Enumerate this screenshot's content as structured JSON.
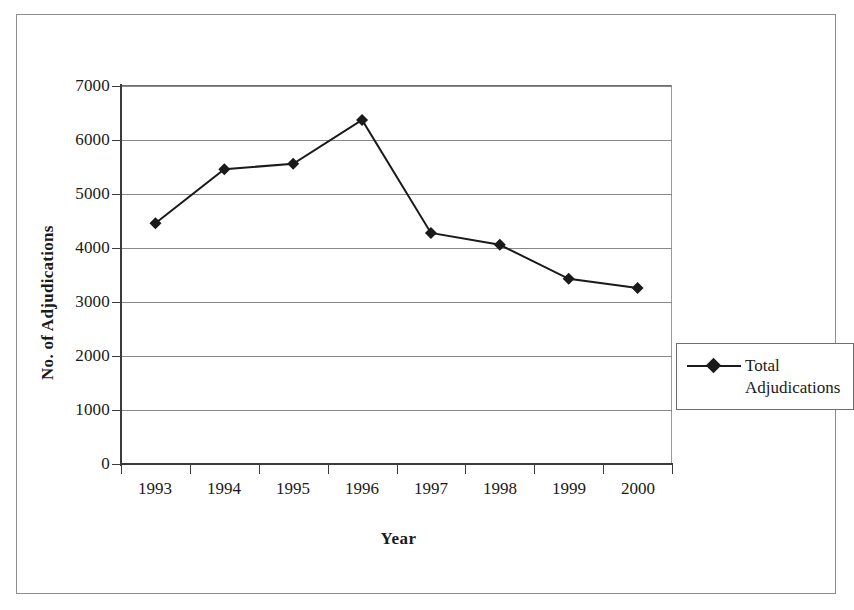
{
  "chart_data": {
    "type": "line",
    "title": "",
    "xlabel": "Year",
    "ylabel": "No. of Adjudications",
    "categories": [
      "1993",
      "1994",
      "1995",
      "1996",
      "1997",
      "1998",
      "1999",
      "2000"
    ],
    "series": [
      {
        "name": "Total Adjudications",
        "marker": "diamond",
        "color": "#1a1a1a",
        "values": [
          4460,
          5460,
          5560,
          6370,
          4280,
          4060,
          3430,
          3260
        ]
      }
    ],
    "ylim": [
      0,
      7000
    ],
    "ytick_values": [
      0,
      1000,
      2000,
      3000,
      4000,
      5000,
      6000,
      7000
    ],
    "ytick_labels": [
      "0",
      "1000",
      "2000",
      "3000",
      "4000",
      "5000",
      "6000",
      "7000"
    ],
    "grid": "horizontal",
    "legend_position": "right",
    "legend_entries": [
      "Total Adjudications"
    ]
  },
  "legend": {
    "entry_line_1": "Total",
    "entry_line_2": "Adjudications"
  },
  "axes": {
    "y_title": "No. of Adjudications",
    "x_title": "Year"
  }
}
